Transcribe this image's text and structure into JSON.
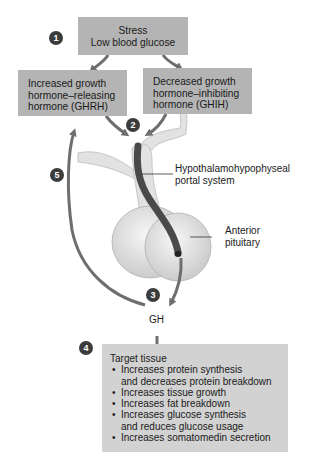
{
  "steps": {
    "s1": "1",
    "s2": "2",
    "s3": "3",
    "s4": "4",
    "s5": "5"
  },
  "boxes": {
    "stimulus": {
      "line1": "Stress",
      "line2": "Low blood glucose"
    },
    "ghrh": {
      "line1": "Increased growth",
      "line2": "hormone–releasing",
      "line3": "hormone (GHRH)"
    },
    "ghih": {
      "line1": "Decreased growth",
      "line2": "hormone–inhibiting",
      "line3": "hormone (GHIH)"
    },
    "target": {
      "title": "Target tissue",
      "effects": [
        {
          "line1": "Increases protein synthesis",
          "line2": "and decreases protein breakdown"
        },
        {
          "line1": "Increases tissue growth"
        },
        {
          "line1": "Increases fat breakdown"
        },
        {
          "line1": "Increases glucose synthesis",
          "line2": "and reduces glucose usage"
        },
        {
          "line1": "Increases somatomedin secretion"
        }
      ]
    }
  },
  "labels": {
    "portal": {
      "line1": "Hypothalamohypophyseal",
      "line2": "portal system"
    },
    "pituitary": {
      "line1": "Anterior",
      "line2": "pituitary"
    },
    "gh": "GH"
  },
  "colors": {
    "box": "#b4b4b4",
    "target_box": "#d2d2d2",
    "arrow": "#6e6e6e",
    "vessel": "#4a4a4a",
    "gland": "#e6e6e6"
  }
}
